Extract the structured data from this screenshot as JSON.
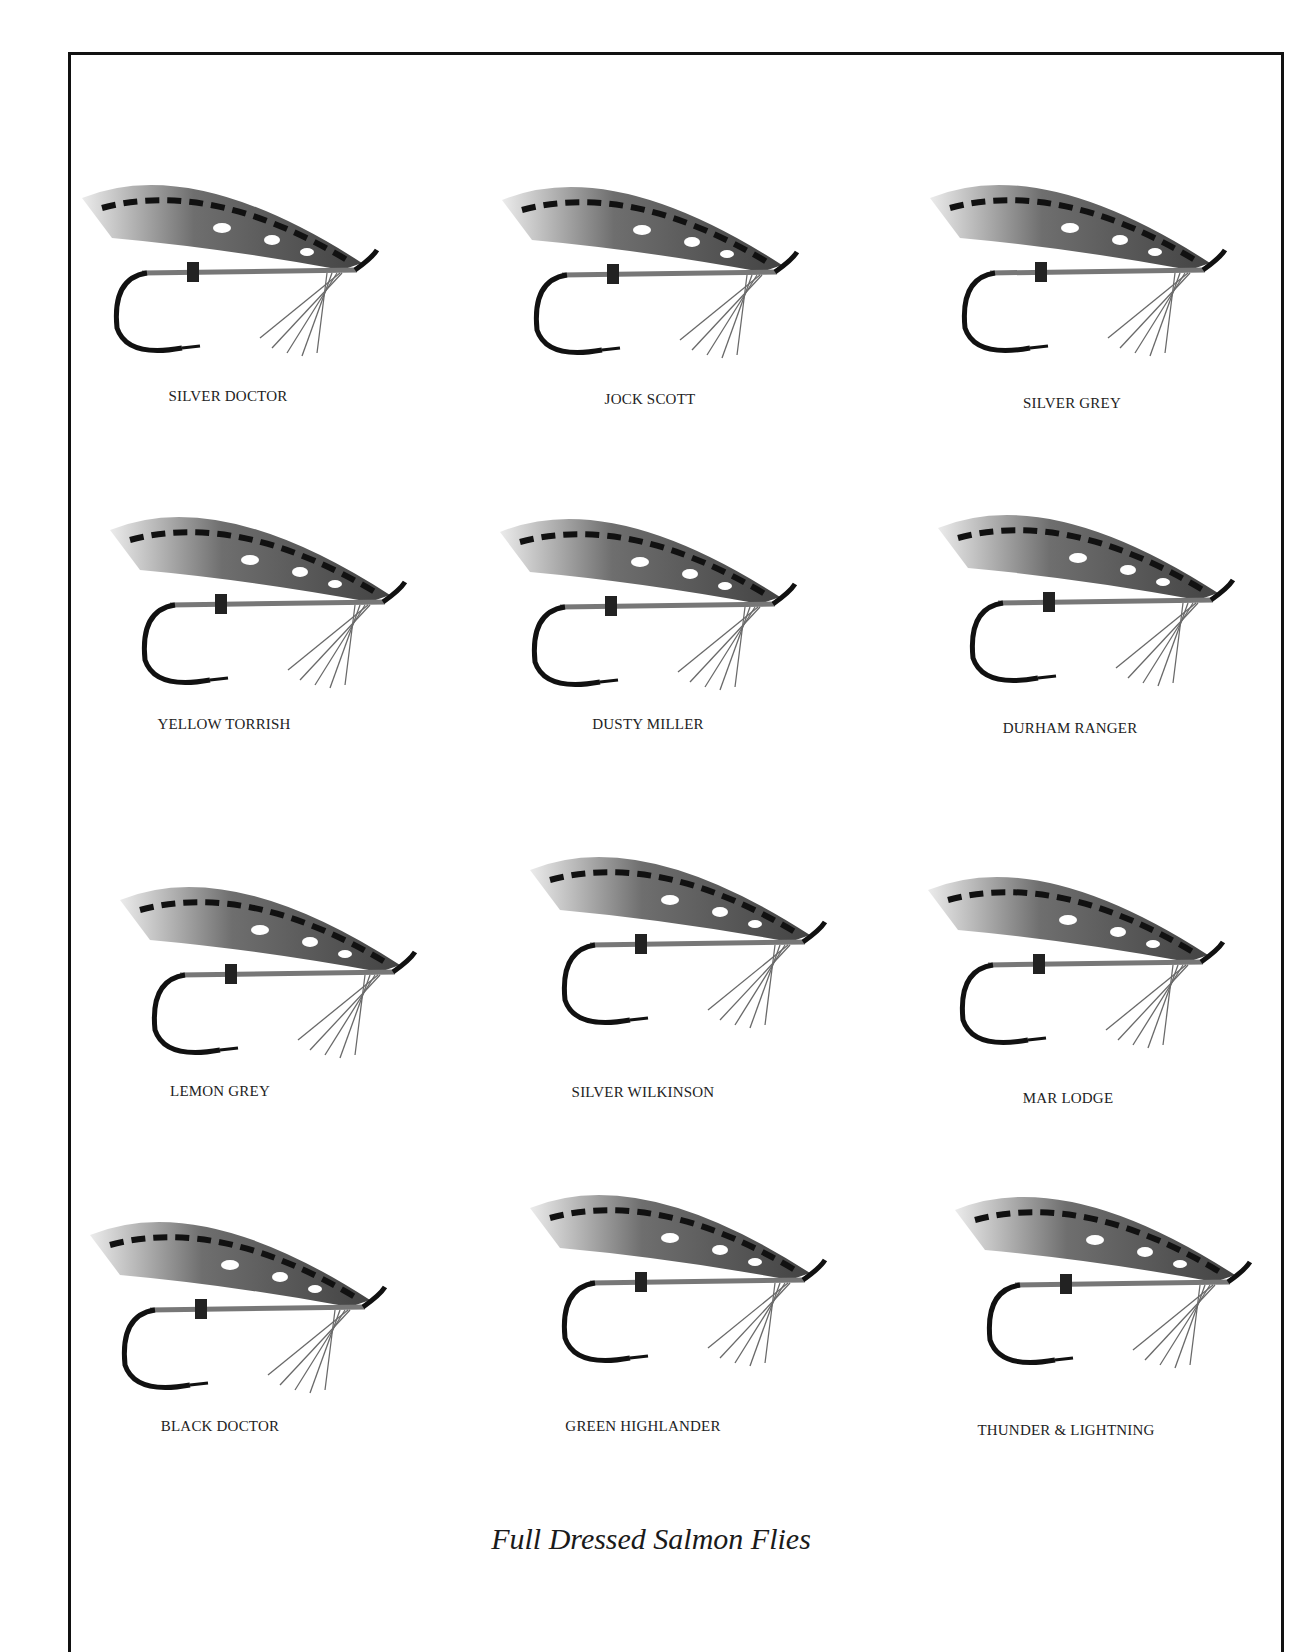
{
  "page": {
    "caption": "Full Dressed Salmon Flies"
  },
  "flies": [
    {
      "name": "SILVER DOCTOR",
      "label_x": 228,
      "label_y": 398,
      "img_x": 72,
      "img_y": 158
    },
    {
      "name": "JOCK SCOTT",
      "label_x": 650,
      "label_y": 401,
      "img_x": 492,
      "img_y": 160
    },
    {
      "name": "SILVER GREY",
      "label_x": 1072,
      "label_y": 405,
      "img_x": 920,
      "img_y": 158
    },
    {
      "name": "YELLOW TORRISH",
      "label_x": 224,
      "label_y": 726,
      "img_x": 100,
      "img_y": 490
    },
    {
      "name": "DUSTY MILLER",
      "label_x": 648,
      "label_y": 726,
      "img_x": 490,
      "img_y": 492
    },
    {
      "name": "DURHAM RANGER",
      "label_x": 1070,
      "label_y": 730,
      "img_x": 928,
      "img_y": 488
    },
    {
      "name": "LEMON GREY",
      "label_x": 220,
      "label_y": 1093,
      "img_x": 110,
      "img_y": 860
    },
    {
      "name": "SILVER WILKINSON",
      "label_x": 643,
      "label_y": 1094,
      "img_x": 520,
      "img_y": 830
    },
    {
      "name": "MAR LODGE",
      "label_x": 1068,
      "label_y": 1100,
      "img_x": 918,
      "img_y": 850
    },
    {
      "name": "BLACK DOCTOR",
      "label_x": 220,
      "label_y": 1428,
      "img_x": 80,
      "img_y": 1195
    },
    {
      "name": "GREEN HIGHLANDER",
      "label_x": 643,
      "label_y": 1428,
      "img_x": 520,
      "img_y": 1168
    },
    {
      "name": "THUNDER & LIGHTNING",
      "label_x": 1066,
      "label_y": 1432,
      "img_x": 945,
      "img_y": 1170
    }
  ]
}
